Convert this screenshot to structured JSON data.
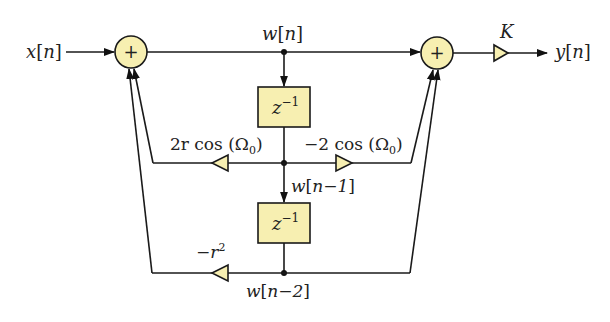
{
  "diagram": {
    "colors": {
      "block_fill": "#f7efb1",
      "stroke": "#1a1a1a",
      "background": "#ffffff"
    },
    "signals": {
      "input": {
        "name": "x",
        "index": "n"
      },
      "output": {
        "name": "y",
        "index": "n"
      },
      "w0": {
        "name": "w",
        "index": "n"
      },
      "w1": {
        "name": "w",
        "index": "n−1"
      },
      "w2": {
        "name": "w",
        "index": "n−2"
      }
    },
    "summers": [
      {
        "id": "sum-left",
        "symbol": "+"
      },
      {
        "id": "sum-right",
        "symbol": "+"
      }
    ],
    "delays": [
      {
        "id": "delay-1",
        "base": "z",
        "exp": "−1"
      },
      {
        "id": "delay-2",
        "base": "z",
        "exp": "−1"
      }
    ],
    "gains": {
      "k": "K",
      "a1_pre": "2r cos (Ω",
      "a1_sub": "0",
      "a1_post": ")",
      "b1_pre": "−2 cos (Ω",
      "b1_sub": "0",
      "b1_post": ")",
      "a2_base": "−r",
      "a2_exp": "2"
    }
  }
}
